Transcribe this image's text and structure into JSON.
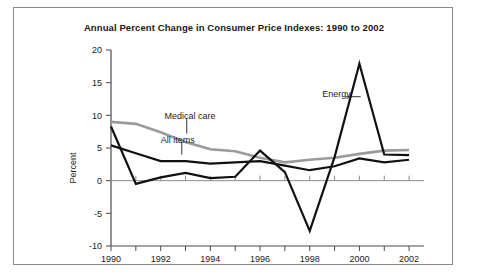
{
  "chart_data": {
    "type": "line",
    "title": "Annual Percent Change in Consumer Price Indexes: 1990 to 2002",
    "xlabel": "",
    "ylabel": "Percent",
    "x": [
      1990,
      1991,
      1992,
      1993,
      1994,
      1995,
      1996,
      1997,
      1998,
      1999,
      2000,
      2001,
      2002
    ],
    "xlim": [
      1990,
      2002.6
    ],
    "ylim": [
      -10,
      20
    ],
    "yticks": [
      -10,
      -5,
      0,
      5,
      10,
      15,
      20
    ],
    "ytick_labels": [
      "-10",
      "-5",
      "0",
      "5",
      "10",
      "15",
      "20"
    ],
    "xticks": [
      1990,
      1991,
      1992,
      1993,
      1994,
      1995,
      1996,
      1997,
      1998,
      1999,
      2000,
      2001,
      2002
    ],
    "xtick_labels": [
      "1990",
      "",
      "1992",
      "",
      "1994",
      "",
      "1996",
      "",
      "1998",
      "",
      "2000",
      "",
      "2002"
    ],
    "grid": false,
    "legend_position": "inline-annotations",
    "series": [
      {
        "name": "Medical care",
        "color": "#9a9a9a",
        "width": 2.6,
        "values": [
          9.0,
          8.7,
          7.4,
          5.9,
          4.8,
          4.5,
          3.5,
          2.8,
          3.2,
          3.5,
          4.1,
          4.6,
          4.7
        ]
      },
      {
        "name": "All items",
        "color": "#111111",
        "width": 2.2,
        "values": [
          5.4,
          4.2,
          3.0,
          3.0,
          2.6,
          2.8,
          3.0,
          2.3,
          1.6,
          2.2,
          3.4,
          2.8,
          3.2
        ]
      },
      {
        "name": "Energy",
        "color": "#111111",
        "width": 2.2,
        "values": [
          8.3,
          -0.5,
          0.5,
          1.2,
          0.4,
          0.6,
          4.6,
          1.3,
          -7.7,
          3.6,
          17.9,
          4.0,
          3.9
        ]
      }
    ],
    "annotations": [
      {
        "label": "Medical care",
        "x": 1992.15,
        "y": 9.9
      },
      {
        "label": "All items",
        "x": 1992.0,
        "y": 6.3
      },
      {
        "label": "Energy",
        "x": 1998.5,
        "y": 13.2
      }
    ]
  }
}
